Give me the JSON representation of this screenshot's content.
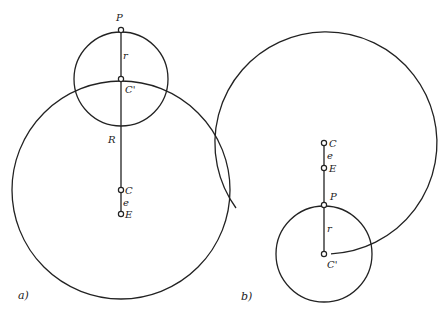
{
  "panels": [
    {
      "id": "a",
      "label": "a)",
      "labels": {
        "P": "P",
        "r": "r",
        "Cprime": "C'",
        "R": "R",
        "C": "C",
        "e": "e",
        "E": "E"
      }
    },
    {
      "id": "b",
      "label": "b)",
      "labels": {
        "C": "C",
        "e": "e",
        "E": "E",
        "P": "P",
        "r": "r",
        "Cprime": "C'"
      }
    }
  ]
}
